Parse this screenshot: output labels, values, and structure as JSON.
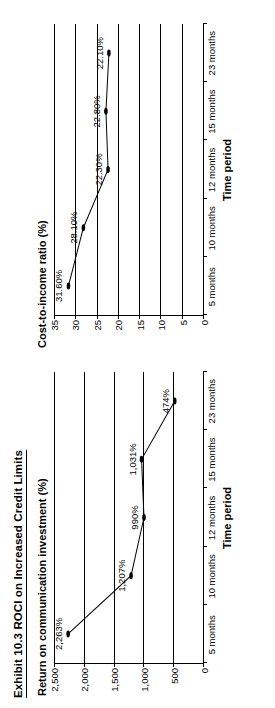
{
  "exhibit": {
    "title": "Exhibit 10.3  ROCI on Increased Credit Limits"
  },
  "charts": [
    {
      "title": "Return on communication investment (%)",
      "xlabel": "Time period",
      "ytick_labels": [
        "2,500",
        "2,000",
        "1,500",
        "1,000",
        "500",
        "0"
      ],
      "xtick_labels": [
        "5 months",
        "10 months",
        "12 months",
        "15 months",
        "23 months"
      ],
      "point_labels": [
        "2,263%",
        "1,207%",
        "990%",
        "1,031%",
        "474%"
      ]
    },
    {
      "title": "Cost-to-income ratio (%)",
      "xlabel": "Time period",
      "ytick_labels": [
        "35",
        "30",
        "25",
        "20",
        "15",
        "10",
        "5",
        "0"
      ],
      "xtick_labels": [
        "5 months",
        "10 months",
        "12 months",
        "15 months",
        "23 months"
      ],
      "point_labels": [
        "31.60%",
        "28.10%",
        "22.30%",
        "22.80%",
        "22.10%"
      ]
    }
  ],
  "chart_data": [
    {
      "type": "line",
      "title": "Return on communication investment (%)",
      "xlabel": "Time period",
      "ylabel": "Return on communication investment (%)",
      "categories": [
        "5 months",
        "10 months",
        "12 months",
        "15 months",
        "23 months"
      ],
      "values": [
        2263,
        1207,
        990,
        1031,
        474
      ],
      "point_labels": [
        "2,263%",
        "1,207%",
        "990%",
        "1,031%",
        "474%"
      ],
      "yticks": [
        0,
        500,
        1000,
        1500,
        2000,
        2500
      ],
      "ytick_labels": [
        "0",
        "500",
        "1,000",
        "1,500",
        "2,000",
        "2,500"
      ],
      "ylim": [
        0,
        2500
      ],
      "grid": true,
      "legend": false,
      "markers": "filled-circle",
      "line_color": "#000000"
    },
    {
      "type": "line",
      "title": "Cost-to-income ratio (%)",
      "xlabel": "Time period",
      "ylabel": "Cost-to-income ratio (%)",
      "categories": [
        "5 months",
        "10 months",
        "12 months",
        "15 months",
        "23 months"
      ],
      "values": [
        31.6,
        28.1,
        22.3,
        22.8,
        22.1
      ],
      "point_labels": [
        "31.60%",
        "28.10%",
        "22.30%",
        "22.80%",
        "22.10%"
      ],
      "yticks": [
        0,
        5,
        10,
        15,
        20,
        25,
        30,
        35
      ],
      "ytick_labels": [
        "0",
        "5",
        "10",
        "15",
        "20",
        "25",
        "30",
        "35"
      ],
      "ylim": [
        0,
        35
      ],
      "grid": true,
      "legend": false,
      "markers": "filled-circle",
      "line_color": "#000000"
    }
  ]
}
